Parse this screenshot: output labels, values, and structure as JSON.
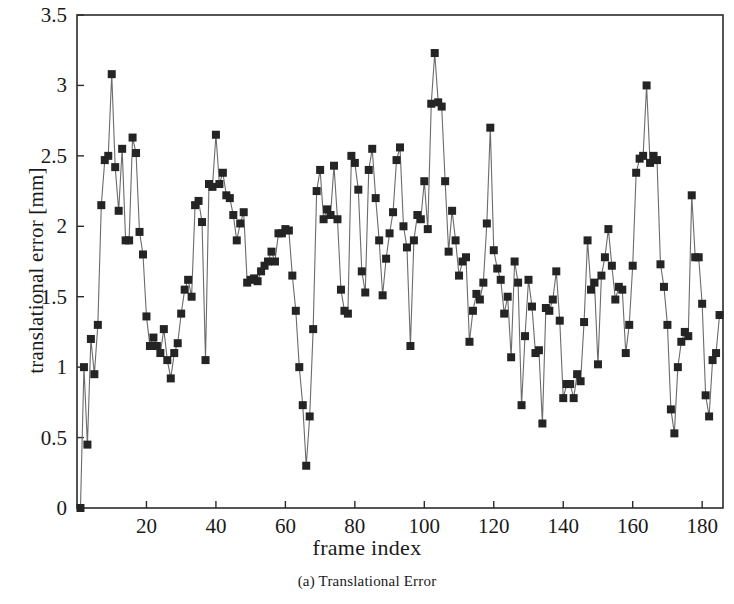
{
  "figure": {
    "caption": "(a) Translational Error",
    "xlabel": "frame index",
    "ylabel": "translational error [mm]"
  },
  "axes": {
    "y_ticks": [
      "0",
      "0.5",
      "1",
      "1.5",
      "2",
      "2.5",
      "3",
      "3.5"
    ],
    "x_ticks": [
      "20",
      "40",
      "60",
      "80",
      "100",
      "120",
      "140",
      "160",
      "180"
    ],
    "frame_color": "#2b2b2b",
    "marker_color": "#242424",
    "line_color": "#6b6b6b"
  },
  "chart_data": {
    "type": "line",
    "title": "(a) Translational Error",
    "xlabel": "frame index",
    "ylabel": "translational error [mm]",
    "xlim": [
      0,
      186
    ],
    "ylim": [
      0,
      3.5
    ],
    "grid": false,
    "legend": "none",
    "marker": "filled-square",
    "x_tick_values": [
      20,
      40,
      60,
      80,
      100,
      120,
      140,
      160,
      180
    ],
    "y_tick_values": [
      0,
      0.5,
      1,
      1.5,
      2,
      2.5,
      3,
      3.5
    ],
    "series": [
      {
        "name": "translational error",
        "x": [
          1,
          2,
          3,
          4,
          5,
          6,
          7,
          8,
          9,
          10,
          11,
          12,
          13,
          14,
          15,
          16,
          17,
          18,
          19,
          20,
          21,
          22,
          23,
          24,
          25,
          26,
          27,
          28,
          29,
          30,
          31,
          32,
          33,
          34,
          35,
          36,
          37,
          38,
          39,
          40,
          41,
          42,
          43,
          44,
          45,
          46,
          47,
          48,
          49,
          50,
          51,
          52,
          53,
          54,
          55,
          56,
          57,
          58,
          59,
          60,
          61,
          62,
          63,
          64,
          65,
          66,
          67,
          68,
          69,
          70,
          71,
          72,
          73,
          74,
          75,
          76,
          77,
          78,
          79,
          80,
          81,
          82,
          83,
          84,
          85,
          86,
          87,
          88,
          89,
          90,
          91,
          92,
          93,
          94,
          95,
          96,
          97,
          98,
          99,
          100,
          101,
          102,
          103,
          104,
          105,
          106,
          107,
          108,
          109,
          110,
          111,
          112,
          113,
          114,
          115,
          116,
          117,
          118,
          119,
          120,
          121,
          122,
          123,
          124,
          125,
          126,
          127,
          128,
          129,
          130,
          131,
          132,
          133,
          134,
          135,
          136,
          137,
          138,
          139,
          140,
          141,
          142,
          143,
          144,
          145,
          146,
          147,
          148,
          149,
          150,
          151,
          152,
          153,
          154,
          155,
          156,
          157,
          158,
          159,
          160,
          161,
          162,
          163,
          164,
          165,
          166,
          167,
          168,
          169,
          170,
          171,
          172,
          173,
          174,
          175,
          176,
          177,
          178,
          179,
          180,
          181,
          182,
          183,
          184,
          185
        ],
        "y": [
          0.0,
          1.0,
          0.45,
          1.2,
          0.95,
          1.3,
          2.15,
          2.47,
          2.5,
          3.08,
          2.42,
          2.11,
          2.55,
          1.9,
          1.9,
          2.63,
          2.52,
          1.96,
          1.8,
          1.36,
          1.15,
          1.21,
          1.15,
          1.1,
          1.27,
          1.05,
          0.92,
          1.1,
          1.17,
          1.38,
          1.55,
          1.62,
          1.5,
          2.15,
          2.18,
          2.03,
          1.05,
          2.3,
          2.28,
          2.65,
          2.3,
          2.38,
          2.22,
          2.2,
          2.08,
          1.9,
          2.02,
          2.1,
          1.6,
          1.62,
          1.63,
          1.61,
          1.68,
          1.72,
          1.75,
          1.82,
          1.75,
          1.95,
          1.95,
          1.98,
          1.97,
          1.65,
          1.4,
          1.0,
          0.73,
          0.3,
          0.65,
          1.27,
          2.25,
          2.4,
          2.05,
          2.12,
          2.08,
          2.43,
          2.05,
          1.55,
          1.4,
          1.38,
          2.5,
          2.45,
          2.26,
          1.68,
          1.53,
          2.4,
          2.55,
          2.2,
          1.9,
          1.51,
          1.77,
          1.95,
          2.1,
          2.47,
          2.56,
          2.0,
          1.85,
          1.15,
          1.9,
          2.08,
          2.05,
          2.32,
          1.98,
          2.87,
          3.23,
          2.88,
          2.85,
          2.32,
          1.82,
          2.11,
          1.9,
          1.65,
          1.75,
          1.78,
          1.18,
          1.4,
          1.52,
          1.48,
          1.6,
          2.02,
          2.7,
          1.83,
          1.7,
          1.62,
          1.38,
          1.5,
          1.07,
          1.75,
          1.6,
          0.73,
          1.22,
          1.62,
          1.43,
          1.1,
          1.12,
          0.6,
          1.42,
          1.4,
          1.48,
          1.68,
          1.33,
          0.78,
          0.88,
          0.88,
          0.78,
          0.95,
          0.9,
          1.32,
          1.9,
          1.55,
          1.6,
          1.02,
          1.65,
          1.78,
          1.98,
          1.72,
          1.48,
          1.57,
          1.55,
          1.1,
          1.3,
          1.72,
          2.38,
          2.48,
          2.5,
          3.0,
          2.45,
          2.5,
          2.47,
          1.73,
          1.57,
          1.3,
          0.7,
          0.53,
          1.0,
          1.18,
          1.25,
          1.22,
          2.22,
          1.78,
          1.78,
          1.45,
          0.8,
          0.65,
          1.05,
          1.1,
          1.37
        ]
      }
    ]
  }
}
